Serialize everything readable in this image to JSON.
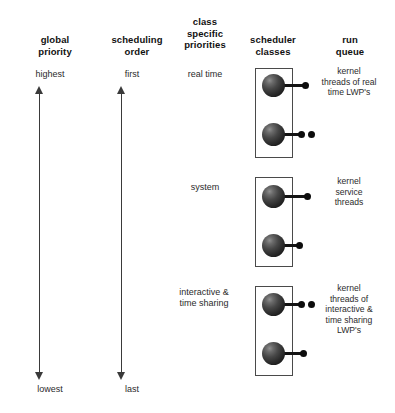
{
  "diagram": {
    "background": "#ffffff",
    "ink": "#1a1a1a"
  },
  "columns": [
    {
      "id": "global-priority",
      "label": "global\npriority",
      "line1": "global",
      "line2": "priority",
      "x": 10,
      "y": 34,
      "width": 90
    },
    {
      "id": "scheduling-order",
      "label": "scheduling\norder",
      "line1": "scheduling",
      "line2": "order",
      "x": 92,
      "y": 34,
      "width": 90
    },
    {
      "id": "class-specific-priorities",
      "label": "class\nspecific\npriorities",
      "line1": "class",
      "line2": "specific",
      "line3": "priorities",
      "x": 160,
      "y": 16,
      "width": 90
    },
    {
      "id": "scheduler-classes",
      "label": "scheduler\nclasses",
      "line1": "scheduler",
      "line2": "classes",
      "x": 228,
      "y": 34,
      "width": 90
    },
    {
      "id": "run-queue",
      "label": "run\nqueue",
      "line1": "run",
      "line2": "queue",
      "x": 305,
      "y": 34,
      "width": 90
    }
  ],
  "axes": [
    {
      "id": "global-priority-axis",
      "top_label": "highest",
      "bottom_label": "lowest",
      "x": 34,
      "top": 86,
      "height": 294,
      "top_label_x": 10,
      "top_label_y": 69,
      "top_label_w": 80,
      "bottom_label_x": 10,
      "bottom_label_y": 384,
      "bottom_label_w": 80
    },
    {
      "id": "scheduling-order-axis",
      "top_label": "first",
      "bottom_label": "last",
      "x": 116,
      "top": 86,
      "height": 294,
      "top_label_x": 92,
      "top_label_y": 69,
      "top_label_w": 80,
      "bottom_label_x": 92,
      "bottom_label_y": 384,
      "bottom_label_w": 80
    }
  ],
  "classes": [
    {
      "id": "real-time",
      "priority_label": "real time",
      "priority_label_x": 160,
      "priority_label_y": 69,
      "priority_label_w": 90,
      "box": {
        "x": 255,
        "y": 68,
        "width": 38,
        "height": 90
      },
      "run_queue_label": "kernel threads of real time LWP's",
      "run_queue_lines": [
        "kernel",
        "threads of real",
        "time LWP's"
      ],
      "run_queue_x": 303,
      "run_queue_y": 66,
      "run_queue_w": 92,
      "threads": [
        {
          "id": "real-time-thread-1",
          "sphere_x": 262,
          "sphere_y": 74,
          "link_len": 28,
          "dots": 1
        },
        {
          "id": "real-time-thread-2",
          "sphere_x": 262,
          "sphere_y": 123,
          "link_len": 24,
          "dots": 2
        }
      ]
    },
    {
      "id": "system",
      "priority_label": "system",
      "priority_label_x": 160,
      "priority_label_y": 182,
      "priority_label_w": 90,
      "box": {
        "x": 255,
        "y": 177,
        "width": 38,
        "height": 90
      },
      "run_queue_label": "kernel service threads",
      "run_queue_lines": [
        "kernel",
        "service",
        "threads"
      ],
      "run_queue_x": 303,
      "run_queue_y": 176,
      "run_queue_w": 92,
      "threads": [
        {
          "id": "system-thread-1",
          "sphere_x": 262,
          "sphere_y": 185,
          "link_len": 30,
          "dots": 1
        },
        {
          "id": "system-thread-2",
          "sphere_x": 262,
          "sphere_y": 234,
          "link_len": 22,
          "dots": 1
        }
      ]
    },
    {
      "id": "interactive-time-sharing",
      "priority_label": "interactive & time sharing",
      "priority_label_lines": [
        "interactive &",
        "time sharing"
      ],
      "priority_label_x": 156,
      "priority_label_y": 287,
      "priority_label_w": 96,
      "box": {
        "x": 255,
        "y": 286,
        "width": 38,
        "height": 90
      },
      "run_queue_label": "kernel threads of interactive & time sharing LWP's",
      "run_queue_lines": [
        "kernel",
        "threads of",
        "interactive &",
        "time sharing",
        "LWP's"
      ],
      "run_queue_x": 303,
      "run_queue_y": 283,
      "run_queue_w": 92,
      "threads": [
        {
          "id": "its-thread-1",
          "sphere_x": 262,
          "sphere_y": 293,
          "link_len": 24,
          "dots": 2
        },
        {
          "id": "its-thread-2",
          "sphere_x": 262,
          "sphere_y": 342,
          "link_len": 26,
          "dots": 1
        }
      ]
    }
  ]
}
